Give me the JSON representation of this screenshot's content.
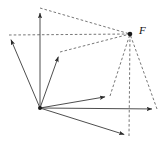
{
  "figure": {
    "width": 165,
    "height": 149,
    "background": "#ffffff",
    "stroke_color": "#3a3a3a",
    "dash_color": "#4a4a4a",
    "labels": [
      {
        "text": "F",
        "x": 139,
        "y": 34,
        "name": "label-F"
      }
    ]
  },
  "chart_data": {
    "type": "scatter",
    "title": "",
    "xlabel": "",
    "ylabel": "",
    "grid": false,
    "legend": null,
    "xlim": [
      0,
      165
    ],
    "ylim": [
      0,
      149
    ],
    "points": [
      {
        "id": "O",
        "label": "",
        "x": 40,
        "y": 108,
        "role": "origin"
      },
      {
        "id": "F",
        "label": "F",
        "x": 130,
        "y": 34,
        "role": "resultant"
      },
      {
        "id": "A",
        "label": "",
        "x": 40,
        "y": 8,
        "role": "vector-tip"
      },
      {
        "id": "B",
        "label": "",
        "x": 9,
        "y": 35,
        "role": "vector-tip"
      },
      {
        "id": "C",
        "label": "",
        "x": 60,
        "y": 52,
        "role": "vector-tip"
      },
      {
        "id": "D",
        "label": "",
        "x": 110,
        "y": 96,
        "role": "vector-tip"
      },
      {
        "id": "E",
        "label": "",
        "x": 157,
        "y": 109,
        "role": "vector-tip"
      },
      {
        "id": "G",
        "label": "",
        "x": 129,
        "y": 136,
        "role": "vector-tip"
      }
    ],
    "vectors": [
      {
        "name": "vector-O-A",
        "from": "O",
        "to": "A",
        "style": "solid",
        "arrow": true
      },
      {
        "name": "vector-O-B",
        "from": "O",
        "to": "B",
        "style": "solid",
        "arrow": true
      },
      {
        "name": "vector-O-C",
        "from": "O",
        "to": "C",
        "style": "solid",
        "arrow": true
      },
      {
        "name": "vector-O-D",
        "from": "O",
        "to": "D",
        "style": "solid",
        "arrow": true
      },
      {
        "name": "vector-O-E",
        "from": "O",
        "to": "E",
        "style": "solid",
        "arrow": true
      },
      {
        "name": "vector-O-G",
        "from": "O",
        "to": "G",
        "style": "solid",
        "arrow": true
      }
    ],
    "guides": [
      {
        "name": "guide-A-F",
        "from": "A",
        "to": "F",
        "style": "dashed"
      },
      {
        "name": "guide-B-F",
        "from": "B",
        "to": "F",
        "style": "dashed"
      },
      {
        "name": "guide-C-F",
        "from": "C",
        "to": "F",
        "style": "dashed"
      },
      {
        "name": "guide-D-F",
        "from": "D",
        "to": "F",
        "style": "dashed"
      },
      {
        "name": "guide-E-F",
        "from": "E",
        "to": "F",
        "style": "dashed"
      },
      {
        "name": "guide-G-F",
        "from": "G",
        "to": "F",
        "style": "dashed"
      }
    ]
  }
}
